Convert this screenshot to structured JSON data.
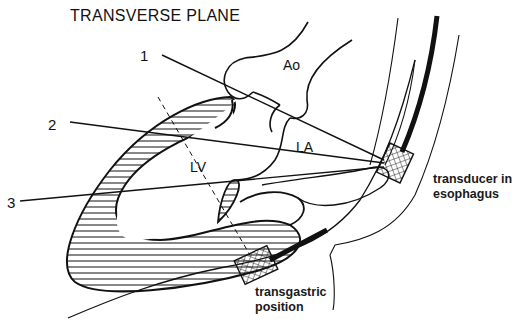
{
  "title": "TRANSVERSE PLANE",
  "scan_lines": [
    {
      "label": "1"
    },
    {
      "label": "2"
    },
    {
      "label": "3"
    }
  ],
  "structures": {
    "aorta": "Ao",
    "left_atrium": "LA",
    "left_ventricle": "LV"
  },
  "annotations": {
    "esophageal_transducer": [
      "transducer in",
      "esophagus"
    ],
    "transgastric_transducer": [
      "transgastric",
      "position"
    ]
  },
  "colors": {
    "ink": "#111111",
    "background": "#ffffff"
  }
}
